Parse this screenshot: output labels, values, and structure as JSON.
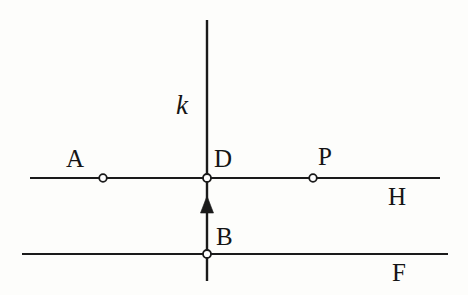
{
  "figure": {
    "kind": "geometry-diagram",
    "background_color": "#fdfdfb",
    "stroke_color": "#1a1a1a",
    "marker_fill_color": "#ffffff",
    "width": 468,
    "height": 295
  },
  "labels": {
    "point_a": "A",
    "point_d": "D",
    "point_p": "P",
    "point_b": "B",
    "line_h": "H",
    "line_f": "F",
    "line_k": "k"
  },
  "geometry": {
    "lines": [
      {
        "name": "H",
        "orientation": "horizontal",
        "x1": 30,
        "y1": 178,
        "x2": 440,
        "y2": 178
      },
      {
        "name": "F",
        "orientation": "horizontal",
        "x1": 22,
        "y1": 254,
        "x2": 448,
        "y2": 254
      },
      {
        "name": "k",
        "orientation": "vertical",
        "x1": 207,
        "y1": 20,
        "x2": 207,
        "y2": 281
      }
    ],
    "points": [
      {
        "label": "A",
        "x": 103,
        "y": 178,
        "on": "H"
      },
      {
        "label": "D",
        "x": 207,
        "y": 178,
        "on": "H and k"
      },
      {
        "label": "P",
        "x": 313,
        "y": 178,
        "on": "H"
      },
      {
        "label": "B",
        "x": 207,
        "y": 254,
        "on": "F and k"
      }
    ],
    "arrow": {
      "name": "direction-arrow-up",
      "on_line": "k",
      "tip_x": 207,
      "tip_y": 197,
      "base_y": 213,
      "half_width": 6,
      "direction": "up"
    }
  }
}
